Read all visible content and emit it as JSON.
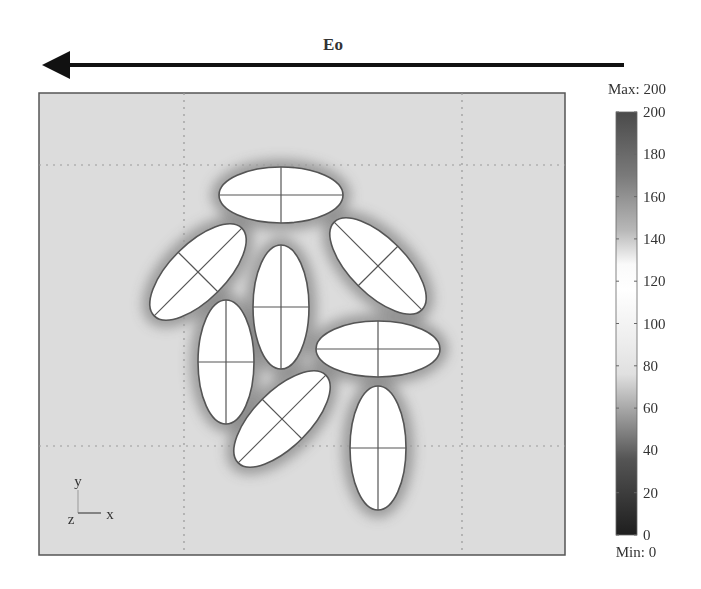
{
  "field_arrow": {
    "label": "Eo",
    "direction": "left"
  },
  "colorbar": {
    "max_label": "Max: 200",
    "min_label": "Min: 0",
    "min": 0,
    "max": 200,
    "ticks": [
      "200",
      "180",
      "160",
      "140",
      "120",
      "100",
      "80",
      "60",
      "40",
      "20",
      "0"
    ],
    "tick_values": [
      200,
      180,
      160,
      140,
      120,
      100,
      80,
      60,
      40,
      20,
      0
    ],
    "colors": {
      "top": "#4a4a4a",
      "peak": "#ffffff",
      "light": "#e8e8e8",
      "bottom": "#1e1e1e"
    }
  },
  "axes_triad": {
    "y": "y",
    "z": "z",
    "x": "x"
  },
  "field_background": "#dcdcdc",
  "particles": [
    {
      "name": "particle-top-horizontal",
      "orientation_deg": 0
    },
    {
      "name": "particle-upper-left-tilted",
      "orientation_deg": -45
    },
    {
      "name": "particle-upper-right-tilted",
      "orientation_deg": 45
    },
    {
      "name": "particle-center-vertical",
      "orientation_deg": 90
    },
    {
      "name": "particle-left-vertical",
      "orientation_deg": 90
    },
    {
      "name": "particle-right-horizontal",
      "orientation_deg": 0
    },
    {
      "name": "particle-lower-tilted",
      "orientation_deg": -45
    },
    {
      "name": "particle-bottom-right-vertical",
      "orientation_deg": 90
    }
  ]
}
